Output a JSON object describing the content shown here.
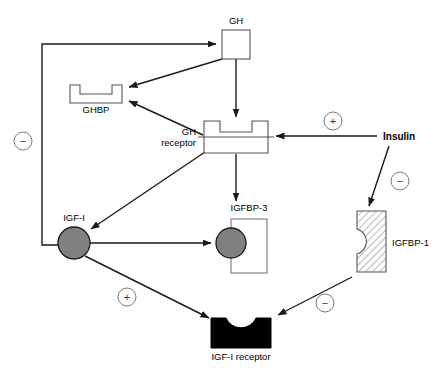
{
  "figure": {
    "kind": "biological-pathway-diagram",
    "background_color": "#ffffff"
  },
  "nodes": {
    "gh": {
      "label": "GH",
      "shape": "square-outline",
      "fill": "#ffffff",
      "stroke": "#555555"
    },
    "ghbp": {
      "label": "GHBP",
      "shape": "notched-rectangle-up",
      "fill": "#ffffff",
      "stroke": "#555555"
    },
    "gh_receptor": {
      "label_line1": "GH",
      "label_line2": "receptor",
      "shape": "notched-rectangle-with-membrane-line",
      "fill": "#ffffff",
      "stroke": "#555555"
    },
    "insulin": {
      "label": "Insulin",
      "shape": "text-only",
      "bold": true
    },
    "igf_i": {
      "label": "IGF-I",
      "shape": "filled-circle",
      "fill": "#808080",
      "stroke": "#1a1a1a"
    },
    "igfbp_3": {
      "label": "IGFBP-3",
      "shape": "tall-rectangle-with-circle",
      "fill": "#ffffff",
      "stroke": "#777777",
      "circle_fill": "#808080"
    },
    "igfbp_1": {
      "label": "IGFBP-1",
      "shape": "hatched-rectangle-with-left-notch",
      "fill": "#ffffff",
      "stroke": "#555555",
      "hatch": "diagonal"
    },
    "igf_i_receptor": {
      "label": "IGF-I receptor",
      "shape": "black-rectangle-with-top-notch",
      "fill": "#000000",
      "stroke": "#000000"
    }
  },
  "signs": {
    "negative_feedback_gh": {
      "symbol": "−",
      "meaning": "inhibition"
    },
    "insulin_positive_gh_receptor": {
      "symbol": "+",
      "meaning": "stimulation"
    },
    "insulin_negative_igfbp1": {
      "symbol": "−",
      "meaning": "inhibition"
    },
    "igf_positive_receptor": {
      "symbol": "+",
      "meaning": "stimulation"
    },
    "igfbp1_negative_receptor": {
      "symbol": "−",
      "meaning": "inhibition"
    }
  },
  "edges": [
    {
      "from": "igf_i",
      "to": "gh",
      "style": "orthogonal-arrow",
      "sign": "−"
    },
    {
      "from": "gh",
      "to": "ghbp",
      "style": "straight-arrow",
      "sign": ""
    },
    {
      "from": "gh",
      "to": "gh_receptor",
      "style": "vertical-arrow",
      "sign": ""
    },
    {
      "from": "gh_receptor",
      "to": "ghbp",
      "style": "straight-arrow",
      "sign": ""
    },
    {
      "from": "insulin",
      "to": "gh_receptor",
      "style": "straight-arrow",
      "sign": "+"
    },
    {
      "from": "insulin",
      "to": "igfbp_1",
      "style": "straight-arrow",
      "sign": "−"
    },
    {
      "from": "gh_receptor",
      "to": "igf_i",
      "style": "straight-arrow",
      "sign": ""
    },
    {
      "from": "gh_receptor",
      "to": "igfbp_3",
      "style": "vertical-arrow",
      "sign": ""
    },
    {
      "from": "igf_i",
      "to": "igfbp_3",
      "style": "straight-arrow",
      "sign": ""
    },
    {
      "from": "igf_i",
      "to": "igf_i_receptor",
      "style": "straight-arrow",
      "sign": "+"
    },
    {
      "from": "igfbp_1",
      "to": "igf_i_receptor",
      "style": "straight-arrow",
      "sign": "−"
    }
  ]
}
